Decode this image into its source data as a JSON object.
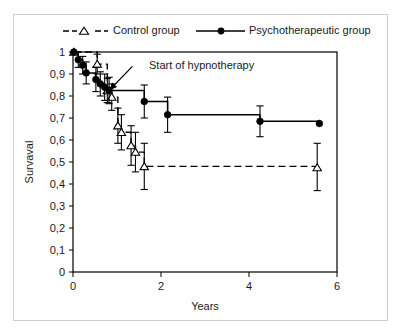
{
  "figure": {
    "title": "",
    "annotation": {
      "label": "Start of hypnotherapy",
      "arrow_from_x": 1.35,
      "arrow_from_y": 0.935,
      "arrow_to_x": 0.82,
      "arrow_to_y": 0.825
    }
  },
  "legend": {
    "position": "top",
    "entries": [
      {
        "label": "Control group",
        "marker": "open-triangle",
        "line": "dashed",
        "color": "#000000"
      },
      {
        "label": "Psychotherapeutic group",
        "marker": "filled-circle",
        "line": "solid",
        "color": "#000000"
      }
    ]
  },
  "axes": {
    "x": {
      "label": "Years",
      "ticks": [
        "0",
        "2",
        "4",
        "6"
      ],
      "tick_values": [
        0,
        2,
        4,
        6
      ],
      "min": 0,
      "max": 6
    },
    "y": {
      "label": "Survaval",
      "ticks": [
        "0",
        "0,1",
        "0,2",
        "0,3",
        "0,4",
        "0,5",
        "0,6",
        "0,7",
        "0,8",
        "0,9",
        "1"
      ],
      "tick_values": [
        0,
        0.1,
        0.2,
        0.3,
        0.4,
        0.5,
        0.6,
        0.7,
        0.8,
        0.9,
        1.0
      ],
      "min": 0,
      "max": 1
    }
  },
  "chart_data": {
    "type": "line",
    "title": "",
    "xlabel": "Years",
    "ylabel": "Survaval",
    "xlim": [
      0,
      6
    ],
    "ylim": [
      0,
      1
    ],
    "grid": false,
    "legend_position": "top",
    "annotations": [
      {
        "text": "Start of hypnotherapy",
        "x": 1.35,
        "y": 0.935,
        "points_to_x": 0.82,
        "points_to_y": 0.825
      }
    ],
    "series": [
      {
        "name": "Psychotherapeutic group",
        "marker": "filled-circle",
        "linestyle": "solid",
        "color": "#000000",
        "points": [
          {
            "x": 0.02,
            "y": 1.0,
            "err_low": 1.0,
            "err_high": 1.0
          },
          {
            "x": 0.12,
            "y": 0.965,
            "err_low": 0.93,
            "err_high": 1.0
          },
          {
            "x": 0.22,
            "y": 0.94,
            "err_low": 0.9,
            "err_high": 0.98
          },
          {
            "x": 0.3,
            "y": 0.905,
            "err_low": 0.855,
            "err_high": 0.955
          },
          {
            "x": 0.52,
            "y": 0.875,
            "err_low": 0.82,
            "err_high": 0.93
          },
          {
            "x": 0.62,
            "y": 0.855,
            "err_low": 0.8,
            "err_high": 0.91
          },
          {
            "x": 0.72,
            "y": 0.84,
            "err_low": 0.78,
            "err_high": 0.9
          },
          {
            "x": 0.82,
            "y": 0.825,
            "err_low": 0.765,
            "err_high": 0.885
          },
          {
            "x": 1.62,
            "y": 0.775,
            "err_low": 0.7,
            "err_high": 0.85
          },
          {
            "x": 2.15,
            "y": 0.715,
            "err_low": 0.635,
            "err_high": 0.795
          },
          {
            "x": 4.25,
            "y": 0.685,
            "err_low": 0.615,
            "err_high": 0.755
          },
          {
            "x": 5.6,
            "y": 0.675,
            "err_low": 0.675,
            "err_high": 0.675
          }
        ]
      },
      {
        "name": "Control group",
        "marker": "open-triangle",
        "linestyle": "dashed",
        "color": "#000000",
        "points": [
          {
            "x": 0.02,
            "y": 1.0,
            "err_low": 1.0,
            "err_high": 1.0
          },
          {
            "x": 0.55,
            "y": 0.945,
            "err_low": 0.9,
            "err_high": 0.99
          },
          {
            "x": 0.78,
            "y": 0.825,
            "err_low": 0.77,
            "err_high": 0.88
          },
          {
            "x": 0.88,
            "y": 0.795,
            "err_low": 0.735,
            "err_high": 0.855
          },
          {
            "x": 1.02,
            "y": 0.665,
            "err_low": 0.585,
            "err_high": 0.745
          },
          {
            "x": 1.1,
            "y": 0.635,
            "err_low": 0.555,
            "err_high": 0.715
          },
          {
            "x": 1.32,
            "y": 0.575,
            "err_low": 0.485,
            "err_high": 0.665
          },
          {
            "x": 1.42,
            "y": 0.545,
            "err_low": 0.455,
            "err_high": 0.635
          },
          {
            "x": 1.62,
            "y": 0.48,
            "err_low": 0.375,
            "err_high": 0.585
          },
          {
            "x": 5.55,
            "y": 0.475,
            "err_low": 0.37,
            "err_high": 0.585
          }
        ]
      }
    ]
  }
}
